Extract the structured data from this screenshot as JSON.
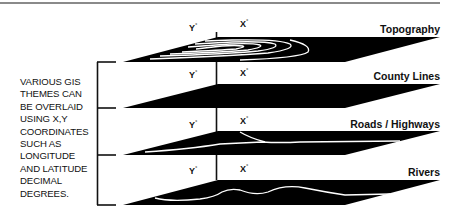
{
  "caption": {
    "lines": [
      "VARIOUS GIS",
      "THEMES CAN",
      "BE OVERLAID",
      "USING X,Y",
      "COORDINATES",
      "SUCH AS",
      "LONGITUDE",
      "AND LATITUDE",
      "DECIMAL",
      "DEGREES."
    ]
  },
  "axes": {
    "y_label": "Y",
    "x_label": "X",
    "degree": "°"
  },
  "layers": [
    {
      "name": "Topography",
      "feature": "contour-lines"
    },
    {
      "name": "County Lines",
      "feature": "none"
    },
    {
      "name": "Roads / Highways",
      "feature": "road-lines"
    },
    {
      "name": "Rivers",
      "feature": "river-line"
    }
  ],
  "colors": {
    "layer_fill": "#000000",
    "feature_stroke": "#ffffff",
    "background": "#ffffff",
    "rule": "#8a8a8a"
  }
}
